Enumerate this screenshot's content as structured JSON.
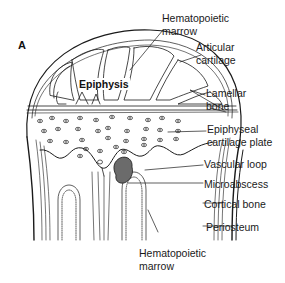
{
  "figure": {
    "panel_letter": "A",
    "region_label": "Epiphysis",
    "labels": {
      "hematopoietic_marrow_top": [
        "Hematopoietic",
        "marrow"
      ],
      "articular_cartilage": [
        "Articular",
        "cartilage"
      ],
      "lamellar_bone": [
        "Lamellar",
        "bone"
      ],
      "epiphyseal_cartilage_plate": [
        "Epiphyseal",
        "cartilage plate"
      ],
      "vascular_loop": "Vascular loop",
      "microabscess": "Microabscess",
      "cortical_bone": "Cortical bone",
      "periosteum": "Periosteum",
      "hematopoietic_marrow_bottom": [
        "Hematopoietic",
        "marrow"
      ]
    },
    "colors": {
      "line": "#1a1a1a",
      "background": "#ffffff",
      "microabscess_fill": "#6b6b6b"
    }
  }
}
